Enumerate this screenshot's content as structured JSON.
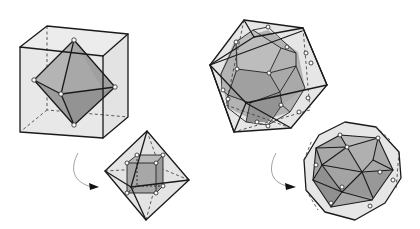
{
  "diagram": {
    "colors": {
      "background": "#ffffff",
      "outer_fill": "#e6e6e6",
      "inner_face_light": "#b9b9b9",
      "inner_face_mid": "#a6a6a6",
      "inner_face_dark": "#8f8f8f",
      "edge": "#1a1a1a",
      "vertex_marker": "#ffffff",
      "arrow": "#888888"
    },
    "panels": [
      {
        "id": "cube-with-inscribed-octahedron",
        "outer_solid": "cube",
        "inner_solid": "octahedron",
        "inner_vertex_count": 6,
        "vertex_markers": "white circles at face centers"
      },
      {
        "id": "octahedron-with-inscribed-cube",
        "outer_solid": "octahedron",
        "inner_solid": "cube",
        "inner_vertex_count": 8,
        "vertex_markers": "white circles at face centers"
      },
      {
        "id": "icosahedron-with-inscribed-dodecahedron",
        "outer_solid": "icosahedron",
        "inner_solid": "dodecahedron",
        "inner_vertex_count": 20,
        "vertex_markers": "white circles at face centers"
      },
      {
        "id": "dodecahedron-with-inscribed-icosahedron",
        "outer_solid": "dodecahedron",
        "inner_solid": "icosahedron",
        "inner_vertex_count": 12,
        "vertex_markers": "white circles at face centers"
      }
    ],
    "arrows": [
      {
        "id": "arrow-cube-to-octahedron",
        "from": "cube-with-inscribed-octahedron",
        "to": "octahedron-with-inscribed-cube",
        "style": "curved, pointing right"
      },
      {
        "id": "arrow-icosahedron-to-dodecahedron",
        "from": "icosahedron-with-inscribed-dodecahedron",
        "to": "dodecahedron-with-inscribed-icosahedron",
        "style": "curved, pointing right"
      }
    ]
  }
}
